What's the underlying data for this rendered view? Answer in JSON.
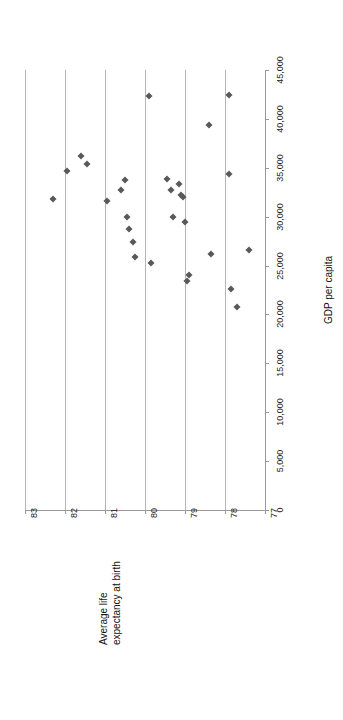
{
  "chart_data": {
    "type": "scatter",
    "title": "",
    "subtitle": "",
    "orientation": "rotated-90",
    "xlabel": "Average life expectancy at birth",
    "ylabel": "GDP per capita",
    "xlim": [
      77,
      83
    ],
    "ylim": [
      0,
      45000
    ],
    "x_ticks": [
      "83",
      "82",
      "81",
      "80",
      "79",
      "78",
      "77"
    ],
    "x_tick_values": [
      83,
      82,
      81,
      80,
      79,
      78,
      77
    ],
    "y_ticks": [
      "0",
      "5,000",
      "10,000",
      "15,000",
      "20,000",
      "25,000",
      "30,000",
      "35,000",
      "40,000",
      "45,000"
    ],
    "y_tick_values": [
      0,
      5000,
      10000,
      15000,
      20000,
      25000,
      30000,
      35000,
      40000,
      45000
    ],
    "grid": "vertical-gridlines-at-x-ticks",
    "legend": "none",
    "marker": "diamond",
    "marker_color": "#595959",
    "gridline_color": "#b5b5b5",
    "axis_color": "#9a9a9a",
    "series": [
      {
        "name": "countries",
        "points": [
          {
            "x": 82.3,
            "y": 31800
          },
          {
            "x": 81.95,
            "y": 34700
          },
          {
            "x": 81.6,
            "y": 36200
          },
          {
            "x": 81.45,
            "y": 35400
          },
          {
            "x": 80.95,
            "y": 31600
          },
          {
            "x": 80.6,
            "y": 32700
          },
          {
            "x": 80.5,
            "y": 33800
          },
          {
            "x": 80.45,
            "y": 30000
          },
          {
            "x": 80.4,
            "y": 28700
          },
          {
            "x": 80.3,
            "y": 27400
          },
          {
            "x": 80.25,
            "y": 25900
          },
          {
            "x": 79.9,
            "y": 42300
          },
          {
            "x": 79.85,
            "y": 25300
          },
          {
            "x": 79.45,
            "y": 33900
          },
          {
            "x": 79.35,
            "y": 32700
          },
          {
            "x": 79.3,
            "y": 30000
          },
          {
            "x": 79.15,
            "y": 33300
          },
          {
            "x": 79.1,
            "y": 32200
          },
          {
            "x": 79.05,
            "y": 32000
          },
          {
            "x": 79.0,
            "y": 29500
          },
          {
            "x": 78.95,
            "y": 23400
          },
          {
            "x": 78.9,
            "y": 24000
          },
          {
            "x": 78.4,
            "y": 39400
          },
          {
            "x": 78.35,
            "y": 26200
          },
          {
            "x": 77.9,
            "y": 42400
          },
          {
            "x": 77.9,
            "y": 34400
          },
          {
            "x": 77.85,
            "y": 22600
          },
          {
            "x": 77.7,
            "y": 20800
          },
          {
            "x": 77.4,
            "y": 26600
          }
        ]
      }
    ]
  }
}
